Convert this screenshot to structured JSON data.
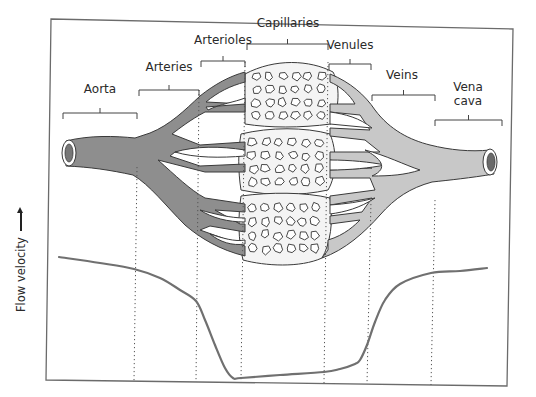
{
  "figure": {
    "type": "blood-vessel-flow-velocity-diagram",
    "frame": {
      "tl": [
        51,
        19
      ],
      "tr": [
        513,
        29
      ],
      "bl": [
        46,
        380
      ],
      "br": [
        507,
        386
      ],
      "stroke": "#6b6b6b"
    },
    "colors": {
      "arterial": "#8e8e8e",
      "venous": "#c8c8c8",
      "capillary_bed": "#f4f4f4",
      "outline": "#3a3a3a",
      "curve": "#707070",
      "divider": "#555555"
    },
    "y_axis_label": "Flow velocity",
    "segments": [
      {
        "name": "Aorta",
        "label_lines": [
          "Aorta"
        ],
        "label_x": 100,
        "label_y": 89,
        "bracket": {
          "x1": 63,
          "x2": 137,
          "y": 113
        }
      },
      {
        "name": "Arteries",
        "label_lines": [
          "Arteries"
        ],
        "label_x": 169,
        "label_y": 67,
        "bracket": {
          "x1": 139,
          "x2": 199,
          "y": 90
        }
      },
      {
        "name": "Arterioles",
        "label_lines": [
          "Arterioles"
        ],
        "label_x": 223,
        "label_y": 40,
        "bracket": {
          "x1": 201,
          "x2": 245,
          "y": 61
        }
      },
      {
        "name": "Capillaries",
        "label_lines": [
          "Capillaries"
        ],
        "label_x": 288,
        "label_y": 23,
        "bracket": {
          "x1": 247,
          "x2": 328,
          "y": 44
        }
      },
      {
        "name": "Venules",
        "label_lines": [
          "Venules"
        ],
        "label_x": 350,
        "label_y": 45,
        "bracket": {
          "x1": 329,
          "x2": 371,
          "y": 64
        }
      },
      {
        "name": "Veins",
        "label_lines": [
          "Veins"
        ],
        "label_x": 402,
        "label_y": 75,
        "bracket": {
          "x1": 372,
          "x2": 435,
          "y": 95
        }
      },
      {
        "name": "Vena cava",
        "label_lines": [
          "Vena",
          "cava"
        ],
        "label_x": 468,
        "label_y": 87,
        "bracket": {
          "x1": 435,
          "x2": 502,
          "y": 120
        }
      }
    ],
    "dividers": [
      {
        "x_top": 137,
        "y_top": 167,
        "x_bot": 134,
        "y_bot": 381
      },
      {
        "x_top": 199,
        "y_top": 90,
        "x_bot": 196,
        "y_bot": 382
      },
      {
        "x_top": 245,
        "y_top": 62,
        "x_bot": 241,
        "y_bot": 382
      },
      {
        "x_top": 328,
        "y_top": 62,
        "x_bot": 324,
        "y_bot": 384
      },
      {
        "x_top": 371,
        "y_top": 200,
        "x_bot": 367,
        "y_bot": 384
      },
      {
        "x_top": 435,
        "y_top": 200,
        "x_bot": 431,
        "y_bot": 385
      }
    ],
    "velocity_curve": {
      "description": "High in aorta/arteries, drops sharply through arterioles, minimum in capillaries, rises through venules/veins, high again in vena cava (slightly below aorta).",
      "points": [
        [
          59,
          257
        ],
        [
          100,
          263
        ],
        [
          134,
          269
        ],
        [
          160,
          278
        ],
        [
          180,
          290
        ],
        [
          196,
          301
        ],
        [
          205,
          320
        ],
        [
          215,
          345
        ],
        [
          225,
          368
        ],
        [
          233,
          378
        ],
        [
          241,
          378
        ],
        [
          280,
          375
        ],
        [
          324,
          372
        ],
        [
          340,
          369
        ],
        [
          355,
          364
        ],
        [
          360,
          360
        ],
        [
          367,
          345
        ],
        [
          375,
          322
        ],
        [
          385,
          300
        ],
        [
          400,
          284
        ],
        [
          431,
          273
        ],
        [
          460,
          271
        ],
        [
          487,
          268
        ]
      ]
    }
  }
}
